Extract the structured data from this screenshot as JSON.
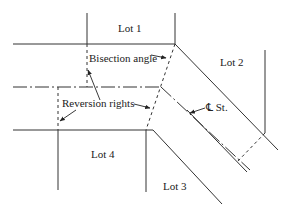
{
  "diagram": {
    "type": "street-intersection-plat",
    "labels": {
      "lot1": "Lot 1",
      "lot2": "Lot 2",
      "lot3": "Lot 3",
      "lot4": "Lot 4",
      "bisection": "Bisection angle",
      "reversion": "Reversion rights",
      "centerline": "℄ St."
    },
    "colors": {
      "line": "#333333",
      "background": "#ffffff"
    }
  }
}
